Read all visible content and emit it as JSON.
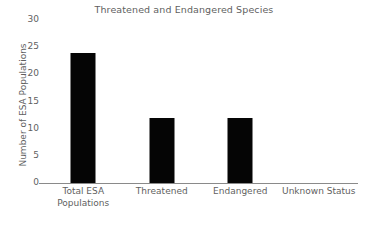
{
  "chart_data": {
    "type": "bar",
    "title": "Threatened and Endangered Species",
    "xlabel": "",
    "ylabel": "Number of ESA Populations",
    "categories": [
      "Total ESA Populations",
      "Threatened",
      "Endangered",
      "Unknown Status"
    ],
    "category_lines": [
      [
        "Total ESA",
        "Populations"
      ],
      [
        "Threatened"
      ],
      [
        "Endangered"
      ],
      [
        "Unknown Status"
      ]
    ],
    "values": [
      24,
      12,
      12,
      0
    ],
    "ylim": [
      0,
      30
    ],
    "yticks": [
      0,
      5,
      10,
      15,
      20,
      25,
      30
    ],
    "ytick_labels": [
      "0",
      "5",
      "10",
      "15",
      "20",
      "25",
      "30"
    ],
    "grid": false,
    "legend": false,
    "bar_color": "#050505",
    "text_color": "#5f5f5f",
    "axis_color": "#8a8a8a",
    "background": "#ffffff"
  }
}
